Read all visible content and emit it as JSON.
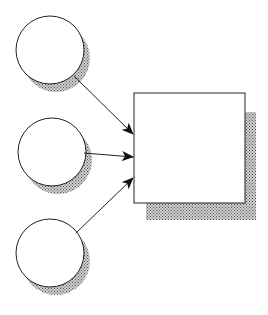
{
  "diagram": {
    "type": "many-to-one flow",
    "nodes": [
      {
        "id": "input-1",
        "shape": "circle",
        "label": ""
      },
      {
        "id": "input-2",
        "shape": "circle",
        "label": ""
      },
      {
        "id": "input-3",
        "shape": "circle",
        "label": ""
      },
      {
        "id": "target",
        "shape": "rectangle",
        "label": ""
      }
    ],
    "edges": [
      {
        "from": "input-1",
        "to": "target"
      },
      {
        "from": "input-2",
        "to": "target"
      },
      {
        "from": "input-3",
        "to": "target"
      }
    ],
    "colors": {
      "stroke": "#222222",
      "fill": "#ffffff",
      "shadow": "#9a9a9a"
    }
  }
}
